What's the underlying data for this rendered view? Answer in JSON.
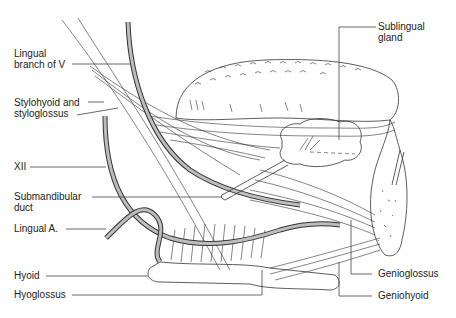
{
  "figure": {
    "type": "anatomical-illustration",
    "colors": {
      "line": "#333333",
      "vessel_fill": "#bdbdbd",
      "background": "#ffffff"
    }
  },
  "labels": {
    "left": [
      {
        "id": "lingual-branch-v",
        "text": "Lingual\nbranch of V"
      },
      {
        "id": "stylohyoid-styloglossus",
        "text": "Stylohyoid and\nstyloglossus"
      },
      {
        "id": "xii",
        "text": "XII"
      },
      {
        "id": "submandibular-duct",
        "text": "Submandibular\nduct"
      },
      {
        "id": "lingual-a",
        "text": "Lingual A."
      },
      {
        "id": "hyoid",
        "text": "Hyoid"
      },
      {
        "id": "hyoglossus",
        "text": "Hyoglossus"
      }
    ],
    "right": [
      {
        "id": "sublingual-gland",
        "text": "Sublingual\ngland"
      },
      {
        "id": "genioglossus",
        "text": "Genioglossus"
      },
      {
        "id": "geniohyoid",
        "text": "Geniohyoid"
      }
    ]
  }
}
